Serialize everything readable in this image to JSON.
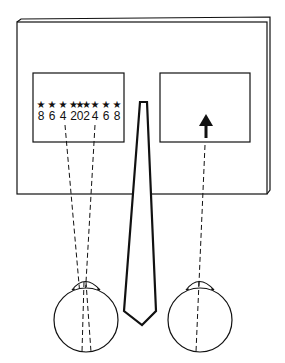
{
  "diagram": {
    "left_panel": {
      "scale_labels": [
        "8",
        "6",
        "4",
        "2",
        "0",
        "2",
        "4",
        "6",
        "8"
      ],
      "marker_symbol": "★"
    },
    "right_panel": {
      "target_symbol": "arrow-up"
    },
    "colors": {
      "ink": "#111111",
      "background": "#ffffff"
    }
  }
}
